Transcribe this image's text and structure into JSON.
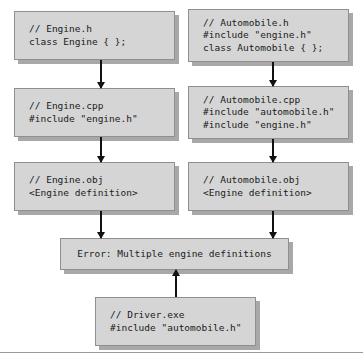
{
  "diagram": {
    "nodes": [
      {
        "id": "engine-h",
        "lines": [
          "// Engine.h",
          "class Engine { };"
        ]
      },
      {
        "id": "automobile-h",
        "lines": [
          "// Automobile.h",
          "#include \"engine.h\"",
          "class Automobile { };"
        ]
      },
      {
        "id": "engine-cpp",
        "lines": [
          "// Engine.cpp",
          "#include \"engine.h\""
        ]
      },
      {
        "id": "automobile-cpp",
        "lines": [
          "// Automobile.cpp",
          "#include \"automobile.h\"",
          "#include \"engine.h\""
        ]
      },
      {
        "id": "engine-obj",
        "lines": [
          "// Engine.obj",
          "<Engine definition>"
        ]
      },
      {
        "id": "automobile-obj",
        "lines": [
          "// Automobile.obj",
          "<Engine definition>"
        ]
      },
      {
        "id": "error",
        "lines": [
          "Error: Multiple engine definitions"
        ]
      },
      {
        "id": "driver",
        "lines": [
          "// Driver.exe",
          "#include \"automobile.h\""
        ]
      }
    ],
    "edges": [
      {
        "from": "engine-h",
        "to": "engine-cpp",
        "direction": "down"
      },
      {
        "from": "automobile-h",
        "to": "automobile-cpp",
        "direction": "down"
      },
      {
        "from": "engine-cpp",
        "to": "engine-obj",
        "direction": "down"
      },
      {
        "from": "automobile-cpp",
        "to": "automobile-obj",
        "direction": "down"
      },
      {
        "from": "engine-obj",
        "to": "error",
        "direction": "down"
      },
      {
        "from": "automobile-obj",
        "to": "error",
        "direction": "down"
      },
      {
        "from": "driver",
        "to": "error",
        "direction": "up"
      }
    ],
    "colors": {
      "box_fill": "#d5d5d5",
      "box_border": "#8f8f8f",
      "box_shadow": "#a8a8a8",
      "arrow": "#111111",
      "text": "#1a1a1a",
      "rule": "#9a9a9a",
      "background": "#ffffff"
    }
  }
}
